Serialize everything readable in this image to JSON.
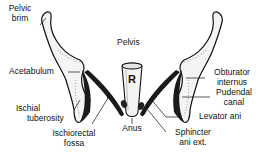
{
  "diagram": {
    "title": "Pelvis",
    "rectum_letter": "R",
    "labels": {
      "pelvic_brim": "Pelvic brim",
      "pelvic_brim_l1": "Pelvic",
      "pelvic_brim_l2": "brim",
      "acetabulum": "Acetabulum",
      "ischial_tuberosity_l1": "Ischial",
      "ischial_tuberosity_l2": "tuberosity",
      "ischiorectal_fossa_l1": "Ischiorectal",
      "ischiorectal_fossa_l2": "fossa",
      "anus": "Anus",
      "sphincter_l1": "Sphincter",
      "sphincter_l2": "ani ext.",
      "levator_ani": "Levator ani",
      "pudendal_canal_l1": "Pudendal",
      "pudendal_canal_l2": "canal",
      "obturator_l1": "Obturator",
      "obturator_l2": "internus"
    },
    "colors": {
      "ink": "#111111",
      "bone_fill": "#f4f4f4",
      "muscle": "#1a1a1a",
      "background": "#ffffff"
    }
  }
}
